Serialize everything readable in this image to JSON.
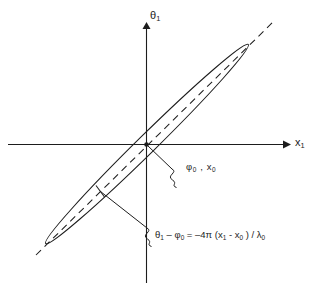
{
  "figure": {
    "kind": "coordinate-diagram",
    "background_color": "#ffffff",
    "line_color": "#1d1d1d",
    "axes": {
      "x_axis_label": "x",
      "x_axis_label_sub": "1",
      "y_axis_label": "θ",
      "y_axis_label_sub": "1",
      "origin_marker": "dot"
    },
    "annotations": {
      "point_label_main": "φ",
      "point_label_main_sub": "0",
      "point_label_sep": " , ",
      "point_label_second": "x",
      "point_label_second_sub": "0",
      "point_label_full": "φ₀ , x₀",
      "equation_full": "θ₁ – φ₀ = –4π (x₁ - x₀ ) / λ₀",
      "equation_parts": {
        "theta": "θ",
        "theta_sub": "1",
        "minus": " – ",
        "phi": "φ",
        "phi_sub": "0",
        "equals": " = ",
        "coefficient": "–4π (x",
        "x1_sub": "1",
        "inner_minus": " - x",
        "x0_sub": "0",
        "close": " ) / λ",
        "lambda_sub": "0"
      }
    },
    "shapes": {
      "ellipse_description": "narrow tilted ellipse centered at origin",
      "dashed_line_description": "dashed diagonal axis through the ellipse",
      "tick_description": "tick mark on lower-left edge of ellipse",
      "leader_description": "squiggly leader lines to annotations"
    }
  }
}
